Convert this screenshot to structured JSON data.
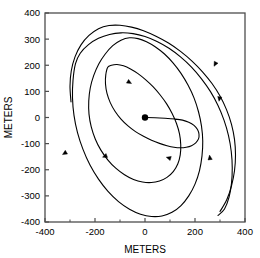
{
  "chart_data": {
    "type": "line",
    "title": "",
    "xlabel": "METERS",
    "ylabel": "METERS",
    "xlim": [
      -400,
      400
    ],
    "ylim": [
      -400,
      400
    ],
    "xticks": [
      -400,
      -200,
      0,
      200,
      400
    ],
    "xticklabels": [
      "-400",
      "-200",
      "0",
      "200",
      "400"
    ],
    "xminorticks": [
      -300,
      -100,
      100,
      300
    ],
    "yticks": [
      -400,
      -300,
      -200,
      -100,
      0,
      100,
      200,
      300,
      400
    ],
    "yticklabels": [
      "-400",
      "-300",
      "-200",
      "-100",
      "0",
      "100",
      "200",
      "300",
      "400"
    ],
    "grid": false,
    "legend": null,
    "line_color": "#000000",
    "line_width": 1.1,
    "frame_color": "#4d4d4d",
    "start_marker": {
      "x": 0,
      "y": 0,
      "label": "start",
      "size": 3.2
    },
    "direction": "clockwise",
    "series": [
      {
        "name": "trajectory",
        "points": [
          [
            0,
            0
          ],
          [
            40,
            -1
          ],
          [
            80,
            -3
          ],
          [
            120,
            -6
          ],
          [
            150,
            -10
          ],
          [
            175,
            -18
          ],
          [
            196,
            -30
          ],
          [
            210,
            -46
          ],
          [
            216,
            -64
          ],
          [
            214,
            -82
          ],
          [
            203,
            -97
          ],
          [
            186,
            -108
          ],
          [
            165,
            -114
          ],
          [
            142,
            -116
          ],
          [
            116,
            -114
          ],
          [
            88,
            -108
          ],
          [
            58,
            -99
          ],
          [
            26,
            -87
          ],
          [
            -6,
            -72
          ],
          [
            -38,
            -54
          ],
          [
            -68,
            -32
          ],
          [
            -96,
            -6
          ],
          [
            -120,
            24
          ],
          [
            -139,
            57
          ],
          [
            -152,
            92
          ],
          [
            -158,
            128
          ],
          [
            -157,
            162
          ],
          [
            -149,
            192
          ],
          [
            -134,
            200
          ],
          [
            -112,
            203
          ],
          [
            -86,
            198
          ],
          [
            -58,
            186
          ],
          [
            -28,
            168
          ],
          [
            2,
            145
          ],
          [
            32,
            118
          ],
          [
            60,
            87
          ],
          [
            86,
            53
          ],
          [
            108,
            16
          ],
          [
            126,
            -23
          ],
          [
            138,
            -63
          ],
          [
            143,
            -104
          ],
          [
            141,
            -143
          ],
          [
            131,
            -178
          ],
          [
            113,
            -207
          ],
          [
            88,
            -229
          ],
          [
            58,
            -243
          ],
          [
            25,
            -249
          ],
          [
            -10,
            -247
          ],
          [
            -46,
            -237
          ],
          [
            -82,
            -219
          ],
          [
            -117,
            -194
          ],
          [
            -149,
            -162
          ],
          [
            -177,
            -124
          ],
          [
            -199,
            -82
          ],
          [
            -215,
            -36
          ],
          [
            -224,
            13
          ],
          [
            -225,
            63
          ],
          [
            -219,
            113
          ],
          [
            -205,
            161
          ],
          [
            -185,
            205
          ],
          [
            -159,
            243
          ],
          [
            -129,
            275
          ],
          [
            -96,
            296
          ],
          [
            -62,
            305
          ],
          [
            -28,
            302
          ],
          [
            6,
            290
          ],
          [
            42,
            270
          ],
          [
            78,
            243
          ],
          [
            112,
            209
          ],
          [
            144,
            169
          ],
          [
            172,
            124
          ],
          [
            196,
            75
          ],
          [
            214,
            22
          ],
          [
            226,
            -33
          ],
          [
            231,
            -90
          ],
          [
            228,
            -147
          ],
          [
            218,
            -203
          ],
          [
            200,
            -255
          ],
          [
            175,
            -300
          ],
          [
            144,
            -337
          ],
          [
            108,
            -363
          ],
          [
            68,
            -377
          ],
          [
            26,
            -379
          ],
          [
            -18,
            -370
          ],
          [
            -62,
            -351
          ],
          [
            -106,
            -322
          ],
          [
            -148,
            -283
          ],
          [
            -186,
            -236
          ],
          [
            -220,
            -182
          ],
          [
            -248,
            -122
          ],
          [
            -270,
            -58
          ],
          [
            -284,
            8
          ],
          [
            -290,
            75
          ],
          [
            -288,
            142
          ],
          [
            -278,
            206
          ],
          [
            -259,
            246
          ],
          [
            -226,
            279
          ],
          [
            -186,
            303
          ],
          [
            -142,
            318
          ],
          [
            -96,
            324
          ],
          [
            -48,
            321
          ],
          [
            0,
            310
          ],
          [
            48,
            291
          ],
          [
            96,
            265
          ],
          [
            142,
            232
          ],
          [
            186,
            193
          ],
          [
            226,
            148
          ],
          [
            262,
            99
          ],
          [
            292,
            46
          ],
          [
            316,
            -10
          ],
          [
            334,
            -69
          ],
          [
            345,
            -130
          ],
          [
            349,
            -192
          ],
          [
            346,
            -252
          ],
          [
            336,
            -306
          ],
          [
            318,
            -350
          ],
          [
            292,
            -375
          ]
        ]
      },
      {
        "name": "outer-arc",
        "points": [
          [
            -296,
            60
          ],
          [
            -300,
            120
          ],
          [
            -295,
            178
          ],
          [
            -280,
            232
          ],
          [
            -256,
            278
          ],
          [
            -224,
            314
          ],
          [
            -186,
            340
          ],
          [
            -144,
            352
          ],
          [
            -100,
            353
          ],
          [
            -54,
            346
          ],
          [
            -6,
            332
          ],
          [
            44,
            311
          ],
          [
            94,
            285
          ],
          [
            142,
            253
          ],
          [
            188,
            216
          ],
          [
            230,
            175
          ],
          [
            268,
            130
          ],
          [
            300,
            82
          ],
          [
            326,
            30
          ],
          [
            346,
            -26
          ],
          [
            358,
            -84
          ],
          [
            362,
            -144
          ],
          [
            358,
            -204
          ],
          [
            346,
            -262
          ],
          [
            327,
            -315
          ],
          [
            300,
            -360
          ]
        ]
      }
    ],
    "arrows": [
      {
        "x": 276,
        "y": 196,
        "angle": 118,
        "name": "arrow-outer-right-upper"
      },
      {
        "x": 296,
        "y": 62,
        "angle": 100,
        "name": "arrow-outer-right-lower"
      },
      {
        "x": 258,
        "y": -144,
        "angle": 262,
        "name": "arrow-right-lower"
      },
      {
        "x": 85,
        "y": -152,
        "angle": 196,
        "name": "arrow-bottom-mid"
      },
      {
        "x": -170,
        "y": -152,
        "angle": 158,
        "name": "arrow-bottom-left"
      },
      {
        "x": -330,
        "y": -142,
        "angle": 148,
        "name": "arrow-outer-bottom-left"
      },
      {
        "x": -54,
        "y": 130,
        "angle": 30,
        "name": "arrow-inner-top-left"
      }
    ]
  }
}
